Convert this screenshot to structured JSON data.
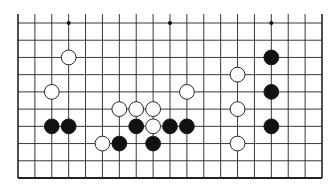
{
  "board": {
    "columns": 19,
    "rows": 10,
    "left": 18,
    "right": 322,
    "top": 23,
    "bottom": 178,
    "top_open_extension": 9,
    "line_color": "#222222",
    "star_points": [
      [
        3,
        0
      ],
      [
        9,
        0
      ],
      [
        15,
        0
      ]
    ],
    "stones": [
      {
        "color": "white",
        "col": 3,
        "row": 2
      },
      {
        "color": "white",
        "col": 2,
        "row": 4
      },
      {
        "color": "black",
        "col": 2,
        "row": 6
      },
      {
        "color": "black",
        "col": 3,
        "row": 6
      },
      {
        "color": "white",
        "col": 5,
        "row": 7
      },
      {
        "color": "black",
        "col": 6,
        "row": 7
      },
      {
        "color": "white",
        "col": 6,
        "row": 5
      },
      {
        "color": "white",
        "col": 7,
        "row": 5
      },
      {
        "color": "white",
        "col": 8,
        "row": 5
      },
      {
        "color": "black",
        "col": 7,
        "row": 6
      },
      {
        "color": "white",
        "col": 8,
        "row": 6
      },
      {
        "color": "black",
        "col": 9,
        "row": 6
      },
      {
        "color": "black",
        "col": 10,
        "row": 6
      },
      {
        "color": "black",
        "col": 8,
        "row": 7
      },
      {
        "color": "white",
        "col": 10,
        "row": 4
      },
      {
        "color": "white",
        "col": 13,
        "row": 3
      },
      {
        "color": "white",
        "col": 13,
        "row": 5
      },
      {
        "color": "white",
        "col": 13,
        "row": 7
      },
      {
        "color": "black",
        "col": 15,
        "row": 2
      },
      {
        "color": "black",
        "col": 15,
        "row": 4
      },
      {
        "color": "black",
        "col": 15,
        "row": 6
      }
    ]
  }
}
